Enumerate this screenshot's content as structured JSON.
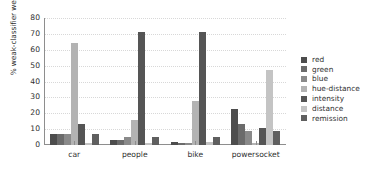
{
  "chart_data": {
    "type": "bar",
    "title": "",
    "xlabel": "",
    "ylabel": "% weak-classifier weights",
    "ylim": [
      0,
      80
    ],
    "yticks": [
      0,
      10,
      20,
      30,
      40,
      50,
      60,
      70,
      80
    ],
    "grid": "horizontal-dotted",
    "legend_position": "right",
    "categories": [
      "car",
      "people",
      "bike",
      "powersocket"
    ],
    "series": [
      {
        "name": "red",
        "color": "#4d4d4d",
        "values": [
          7,
          3,
          2,
          23
        ]
      },
      {
        "name": "green",
        "color": "#6b6b6b",
        "values": [
          7,
          3,
          1,
          13
        ]
      },
      {
        "name": "blue",
        "color": "#8a8a8a",
        "values": [
          7,
          5,
          1,
          9
        ]
      },
      {
        "name": "hue-distance",
        "color": "#b3b3b3",
        "values": [
          64,
          16,
          28,
          1
        ]
      },
      {
        "name": "intensity",
        "color": "#555555",
        "values": [
          13,
          71,
          71,
          11
        ]
      },
      {
        "name": "distance",
        "color": "#c4c4c4",
        "values": [
          1,
          1,
          2,
          47
        ]
      },
      {
        "name": "remission",
        "color": "#5f5f5f",
        "values": [
          7,
          5,
          5,
          9
        ]
      }
    ]
  }
}
